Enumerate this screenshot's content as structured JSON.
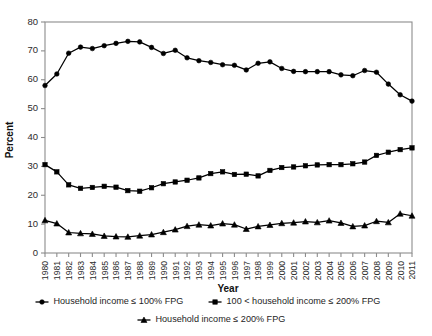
{
  "chart_data": {
    "type": "line",
    "title": "",
    "xlabel": "Year",
    "ylabel": "Percent",
    "ylim": [
      0,
      80
    ],
    "yticks": [
      0,
      10,
      20,
      30,
      40,
      50,
      60,
      70,
      80
    ],
    "grid": false,
    "legend_position": "bottom",
    "x": [
      1980,
      1981,
      1982,
      1983,
      1984,
      1985,
      1986,
      1987,
      1988,
      1989,
      1990,
      1991,
      1992,
      1993,
      1994,
      1995,
      1996,
      1997,
      1998,
      1999,
      2000,
      2001,
      2002,
      2003,
      2004,
      2005,
      2006,
      2007,
      2008,
      2009,
      2010,
      2011
    ],
    "categories": [
      "1980",
      "1981",
      "1982",
      "1983",
      "1984",
      "1985",
      "1986",
      "1987",
      "1988",
      "1989",
      "1990",
      "1991",
      "1992",
      "1993",
      "1994",
      "1995",
      "1996",
      "1997",
      "1998",
      "1999",
      "2000",
      "2001",
      "2002",
      "2003",
      "2004",
      "2005",
      "2006",
      "2007",
      "2008",
      "2009",
      "2010",
      "2011"
    ],
    "series": [
      {
        "name": "Household income ≤ 100% FPG",
        "marker": "circle",
        "color": "#000000",
        "values": [
          58.0,
          62.0,
          69.2,
          71.3,
          70.8,
          71.8,
          72.6,
          73.3,
          73.1,
          71.2,
          69.1,
          70.2,
          67.6,
          66.6,
          66.0,
          65.2,
          65.0,
          63.4,
          65.7,
          66.2,
          63.9,
          62.9,
          62.8,
          62.8,
          62.8,
          61.7,
          61.4,
          63.2,
          62.6,
          58.5,
          54.8,
          52.6
        ]
      },
      {
        "name": "100 < household income ≤ 200% FPG",
        "marker": "square",
        "color": "#000000",
        "values": [
          30.6,
          28.1,
          23.6,
          22.4,
          22.7,
          23.1,
          22.8,
          21.6,
          21.4,
          22.6,
          24.0,
          24.6,
          25.2,
          26.0,
          27.5,
          28.1,
          27.2,
          27.3,
          26.7,
          28.6,
          29.6,
          29.8,
          30.2,
          30.5,
          30.6,
          30.6,
          30.9,
          31.5,
          33.8,
          34.9,
          35.8,
          36.4
        ]
      },
      {
        "name": "Household income ≤ 200% FPG",
        "marker": "triangle",
        "color": "#000000",
        "values": [
          11.3,
          10.2,
          7.1,
          6.8,
          6.6,
          5.9,
          5.7,
          5.6,
          6.0,
          6.4,
          7.2,
          8.1,
          9.3,
          9.8,
          9.5,
          10.2,
          9.8,
          8.3,
          9.2,
          9.7,
          10.3,
          10.5,
          10.9,
          10.6,
          11.2,
          10.4,
          9.2,
          9.5,
          11.0,
          10.6,
          13.6,
          12.9
        ]
      }
    ]
  }
}
